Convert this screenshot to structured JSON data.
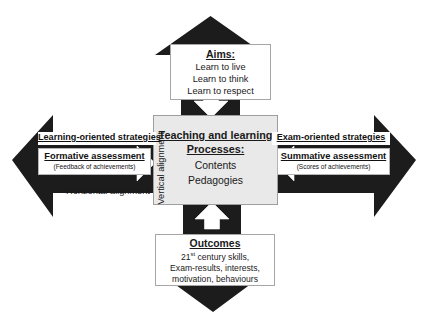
{
  "diagram": {
    "center": {
      "heading_line1": "Teaching and learning",
      "heading_line2": "Processes:",
      "item1": "Contents",
      "item2": "Pedagogies",
      "fill_color": "#e9e9e9"
    },
    "top": {
      "heading": "Aims:",
      "item1": "Learn to live",
      "item2": "Learn to think",
      "item3": "Learn to respect"
    },
    "bottom": {
      "heading": "Outcomes",
      "item1_prefix": "21",
      "item1_sup": "st",
      "item1_suffix": " century skills,",
      "item2": "Exam-results, interests,",
      "item3": "motivation, behaviours"
    },
    "left": {
      "strategy": "Learning-oriented strategies",
      "assessment": "Formative assessment",
      "assessment_note": "(Feedback of achievements)"
    },
    "right": {
      "strategy": "Exam-oriented strategies",
      "assessment": "Summative assessment",
      "assessment_note": "(Scores of achievements)"
    },
    "axes": {
      "horizontal": "Horizontal alignment",
      "vertical": "Vertical alignment"
    },
    "colors": {
      "arrow_black": "#1c1c1c",
      "inner_arrow_white": "#ffffff",
      "box_border": "#a6a6a6"
    }
  }
}
